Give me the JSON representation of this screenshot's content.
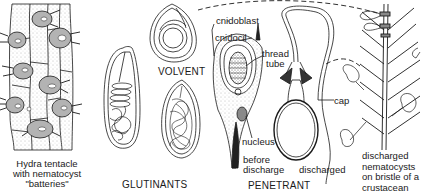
{
  "figure": {
    "colors": {
      "ink": "#1a1a1a",
      "stipple": "#7a7a7a",
      "fill_dark": "#9a9a9a",
      "background": "#ffffff"
    }
  },
  "labels": {
    "hydra": {
      "line1": "Hydra tentacle",
      "line2": "with nematocyst",
      "line3": "\"batteries\""
    },
    "volvent": "VOLVENT",
    "glutinants": "GLUTINANTS",
    "cnidoblast": "cnidoblast",
    "cnidocil": "cnidocil",
    "thread": "thread",
    "tube": "tube",
    "nucleus": "nucleus",
    "before": "before",
    "discharge": "discharge",
    "penetrant": "PENETRANT",
    "discharged": "discharged",
    "cap": "cap",
    "bristle": {
      "line1": "discharged",
      "line2": "nematocysts",
      "line3": "on bristle of a",
      "line4": "crustacean"
    }
  }
}
